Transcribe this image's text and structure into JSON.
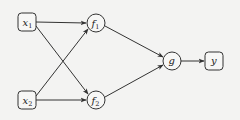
{
  "diagram": {
    "type": "computational-graph",
    "colors": {
      "background": "#f3f3f2",
      "stroke": "#333333",
      "text": "#222222"
    },
    "nodes": [
      {
        "id": "x1",
        "label": "x",
        "sub": "1",
        "shape": "rounded-box",
        "cx": 27,
        "cy": 22
      },
      {
        "id": "x2",
        "label": "x",
        "sub": "2",
        "shape": "rounded-box",
        "cx": 27,
        "cy": 100
      },
      {
        "id": "f1",
        "label": "f",
        "sub": "1",
        "shape": "circle",
        "cx": 96,
        "cy": 23
      },
      {
        "id": "f2",
        "label": "f",
        "sub": "2",
        "shape": "circle",
        "cx": 96,
        "cy": 100
      },
      {
        "id": "g",
        "label": "g",
        "sub": "",
        "shape": "circle",
        "cx": 172,
        "cy": 61
      },
      {
        "id": "y",
        "label": "y",
        "sub": "",
        "shape": "rounded-box",
        "cx": 214,
        "cy": 61
      }
    ],
    "edges": [
      {
        "from": "x1",
        "to": "f1"
      },
      {
        "from": "x1",
        "to": "f2"
      },
      {
        "from": "x2",
        "to": "f1"
      },
      {
        "from": "x2",
        "to": "f2"
      },
      {
        "from": "f1",
        "to": "g"
      },
      {
        "from": "f2",
        "to": "g"
      },
      {
        "from": "g",
        "to": "y"
      }
    ]
  }
}
